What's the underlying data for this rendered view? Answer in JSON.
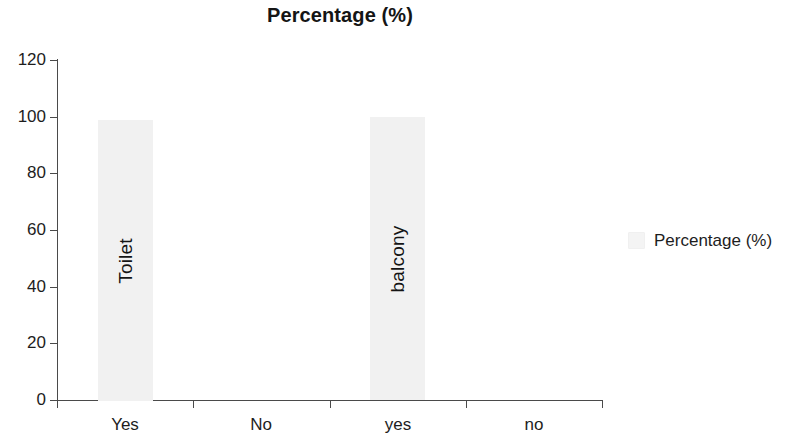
{
  "chart_data": {
    "type": "bar",
    "title": "Percentage (%)",
    "xlabel": "",
    "ylabel": "",
    "categories": [
      "Yes",
      "No",
      "yes",
      "no"
    ],
    "series": [
      {
        "name": "Percentage (%)",
        "values": [
          99,
          0,
          100,
          0
        ]
      }
    ],
    "bar_labels": [
      "Toilet",
      "",
      "balcony",
      ""
    ],
    "ylim": [
      0,
      120
    ],
    "ytick_values": [
      0,
      20,
      40,
      60,
      80,
      100,
      120
    ],
    "ytick_labels": [
      "0",
      "20",
      "40",
      "60",
      "80",
      "100",
      "120"
    ],
    "grid": false,
    "legend": {
      "position": "right",
      "entries": [
        {
          "label": "Percentage (%)",
          "color": "#f1f1f1"
        }
      ]
    },
    "colors": {
      "bar_fill": "#f1f1f1",
      "axis": "#4a4a4a",
      "text": "#1d1d1d",
      "background": "#ffffff"
    }
  }
}
